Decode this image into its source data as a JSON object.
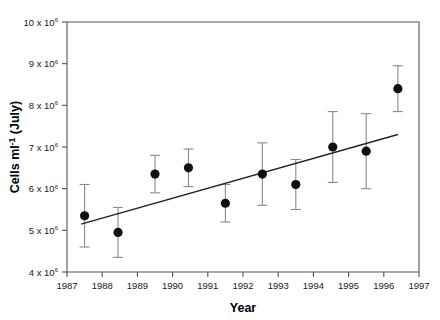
{
  "chart_data": {
    "type": "scatter",
    "title": "",
    "xlabel": "Year",
    "ylabel": "Cells ml-1 (July)",
    "ylabel_parts": {
      "main": "Cells ml",
      "sup": "-1",
      "tail": " (July)"
    },
    "xlim": [
      1987,
      1997
    ],
    "ylim": [
      4000000,
      10000000
    ],
    "grid": false,
    "legend": null,
    "y_tick_values": [
      4000000,
      5000000,
      6000000,
      7000000,
      8000000,
      9000000,
      10000000
    ],
    "y_tick_labels": [
      "4 x 10",
      "5 x 10",
      "6 x 10",
      "7 x 10",
      "8 x 10",
      "9 x 10",
      "10 x 10"
    ],
    "y_tick_exponent": "6",
    "x_tick_values": [
      1987,
      1988,
      1989,
      1990,
      1991,
      1992,
      1993,
      1994,
      1995,
      1996,
      1997
    ],
    "x_tick_labels": [
      "1987",
      "1988",
      "1989",
      "1990",
      "1991",
      "1992",
      "1993",
      "1994",
      "1995",
      "1996",
      "1997"
    ],
    "series": [
      {
        "name": "Cells ml-1 (July)",
        "marker": "filled-circle",
        "marker_color": "#111111",
        "errorbar_color": "#8a8a8a",
        "x": [
          1987.5,
          1988.45,
          1989.5,
          1990.45,
          1991.5,
          1992.55,
          1993.5,
          1994.55,
          1995.5,
          1996.4
        ],
        "y": [
          5350000,
          4950000,
          6350000,
          6500000,
          5650000,
          6350000,
          6100000,
          7000000,
          6900000,
          8400000
        ],
        "yerr": [
          750000,
          600000,
          450000,
          450000,
          450000,
          750000,
          600000,
          850000,
          900000,
          550000
        ]
      }
    ],
    "trendline": {
      "type": "linear-regression",
      "color": "#222222",
      "x": [
        1987.4,
        1996.4
      ],
      "y": [
        5150000,
        7300000
      ]
    }
  }
}
